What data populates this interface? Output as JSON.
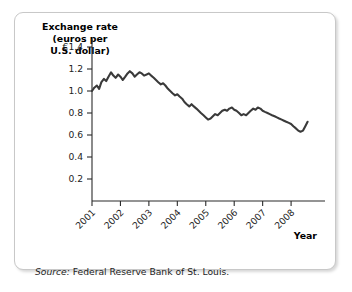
{
  "figure": {
    "title_lines": [
      "Exchange rate",
      "(euros per",
      "U.S. dollar)"
    ],
    "source_label": "Source:",
    "source_text": " Federal Reserve Bank of St. Louis.",
    "xaxis_title": "Year"
  },
  "chart_data": {
    "type": "line",
    "title": "Exchange rate (euros per U.S. dollar)",
    "xlabel": "Year",
    "ylabel": "Exchange rate (euros per U.S. dollar)",
    "xlim": [
      2001.0,
      2008.7
    ],
    "ylim": [
      0,
      1.4
    ],
    "grid": false,
    "legend": null,
    "y_ticks": [
      0.2,
      0.4,
      0.6,
      0.8,
      1.0,
      1.2,
      1.4
    ],
    "y_tick_labels": [
      "0.2",
      "0.4",
      "0.6",
      "0.8",
      "1.0",
      "1.2",
      "€1.4"
    ],
    "x_ticks": [
      2001,
      2002,
      2003,
      2004,
      2005,
      2006,
      2007,
      2008
    ],
    "x_tick_labels": [
      "2001",
      "2002",
      "2003",
      "2004",
      "2005",
      "2006",
      "2007",
      "2008"
    ],
    "currency_symbol": "€",
    "series": [
      {
        "name": "Euros per U.S. dollar",
        "color": "#3a3a3a",
        "x": [
          2001.0,
          2001.08,
          2001.17,
          2001.25,
          2001.33,
          2001.42,
          2001.5,
          2001.58,
          2001.67,
          2001.75,
          2001.83,
          2001.92,
          2002.0,
          2002.08,
          2002.17,
          2002.25,
          2002.33,
          2002.42,
          2002.5,
          2002.58,
          2002.67,
          2002.75,
          2002.83,
          2002.92,
          2003.0,
          2003.08,
          2003.17,
          2003.25,
          2003.33,
          2003.42,
          2003.5,
          2003.58,
          2003.67,
          2003.75,
          2003.83,
          2003.92,
          2004.0,
          2004.08,
          2004.17,
          2004.25,
          2004.33,
          2004.42,
          2004.5,
          2004.58,
          2004.67,
          2004.75,
          2004.83,
          2004.92,
          2005.0,
          2005.08,
          2005.17,
          2005.25,
          2005.33,
          2005.42,
          2005.5,
          2005.58,
          2005.67,
          2005.75,
          2005.83,
          2005.92,
          2006.0,
          2006.08,
          2006.17,
          2006.25,
          2006.33,
          2006.42,
          2006.5,
          2006.58,
          2006.67,
          2006.75,
          2006.83,
          2006.92,
          2007.0,
          2007.08,
          2007.17,
          2007.25,
          2007.33,
          2007.42,
          2007.5,
          2007.58,
          2007.67,
          2007.75,
          2007.83,
          2007.92,
          2008.0,
          2008.08,
          2008.17,
          2008.25,
          2008.33,
          2008.42,
          2008.5,
          2008.58
        ],
        "values": [
          1.0,
          1.03,
          1.05,
          1.02,
          1.08,
          1.11,
          1.09,
          1.13,
          1.17,
          1.14,
          1.12,
          1.15,
          1.13,
          1.1,
          1.13,
          1.16,
          1.18,
          1.16,
          1.13,
          1.15,
          1.17,
          1.16,
          1.14,
          1.15,
          1.16,
          1.14,
          1.12,
          1.1,
          1.08,
          1.06,
          1.07,
          1.05,
          1.02,
          1.0,
          0.98,
          0.96,
          0.97,
          0.95,
          0.93,
          0.9,
          0.88,
          0.86,
          0.88,
          0.86,
          0.84,
          0.82,
          0.8,
          0.78,
          0.76,
          0.74,
          0.75,
          0.77,
          0.79,
          0.78,
          0.8,
          0.82,
          0.83,
          0.82,
          0.84,
          0.85,
          0.83,
          0.82,
          0.8,
          0.78,
          0.79,
          0.78,
          0.8,
          0.82,
          0.84,
          0.83,
          0.85,
          0.84,
          0.82,
          0.81,
          0.8,
          0.79,
          0.78,
          0.77,
          0.76,
          0.75,
          0.74,
          0.73,
          0.72,
          0.71,
          0.7,
          0.68,
          0.66,
          0.64,
          0.63,
          0.64,
          0.68,
          0.72
        ]
      }
    ]
  }
}
